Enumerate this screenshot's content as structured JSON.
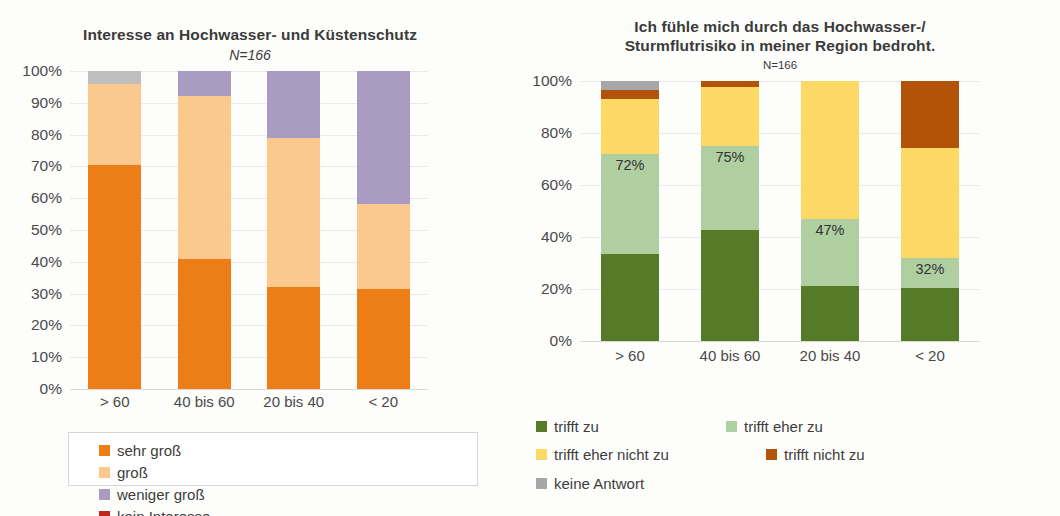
{
  "chart_data": [
    {
      "id": "interest",
      "type": "bar",
      "subtype": "stacked-100",
      "title": "Interesse an Hochwasser- und Küstenschutz",
      "subtitle": "N=166",
      "xlabel": "",
      "ylabel": "",
      "ylim": [
        0,
        100
      ],
      "yticks": [
        "0%",
        "10%",
        "20%",
        "30%",
        "40%",
        "50%",
        "60%",
        "70%",
        "80%",
        "90%",
        "100%"
      ],
      "ytick_values": [
        0,
        10,
        20,
        30,
        40,
        50,
        60,
        70,
        80,
        90,
        100
      ],
      "grid": true,
      "legend_position": "bottom",
      "legend_boxed": true,
      "categories": [
        "> 60",
        "40 bis 60",
        "20 bis 40",
        "< 20"
      ],
      "series": [
        {
          "name": "sehr groß",
          "color": "#ED7D17",
          "values": [
            70.5,
            41.0,
            32.0,
            31.5
          ]
        },
        {
          "name": "groß",
          "color": "#FBC98E",
          "values": [
            25.5,
            51.0,
            47.0,
            26.5
          ]
        },
        {
          "name": "weniger groß",
          "color": "#A99BC1",
          "values": [
            0.0,
            8.0,
            21.0,
            42.0
          ]
        },
        {
          "name": "kein Interesse",
          "color": "#C0271C",
          "values": [
            0.0,
            0.0,
            0.0,
            0.0
          ]
        },
        {
          "name": "keine Antwort",
          "color": "#BFBFBF",
          "values": [
            4.0,
            0.0,
            0.0,
            0.0
          ]
        }
      ],
      "legend_entries": [
        {
          "label": "sehr groß",
          "color": "#ED7D17"
        },
        {
          "label": "groß",
          "color": "#FBC98E"
        },
        {
          "label": "weniger groß",
          "color": "#A99BC1"
        },
        {
          "label": "kein Interesse",
          "color": "#C0271C"
        }
      ]
    },
    {
      "id": "threat",
      "type": "bar",
      "subtype": "stacked-100",
      "title": "Ich fühle mich durch das Hochwasser-/\nSturmflutrisiko in meiner Region bedroht.",
      "title_line1": "Ich fühle mich durch das Hochwasser-/",
      "title_line2": "Sturmflutrisiko in meiner Region bedroht.",
      "subtitle": "N=166",
      "xlabel": "",
      "ylabel": "",
      "ylim": [
        0,
        100
      ],
      "yticks": [
        "0%",
        "20%",
        "40%",
        "60%",
        "80%",
        "100%"
      ],
      "ytick_values": [
        0,
        20,
        40,
        60,
        80,
        100
      ],
      "grid": true,
      "legend_position": "bottom",
      "legend_boxed": false,
      "categories": [
        "> 60",
        "40 bis 60",
        "20 bis 40",
        "< 20"
      ],
      "series": [
        {
          "name": "trifft zu",
          "color": "#557B29",
          "values": [
            33.5,
            42.5,
            21.0,
            20.5
          ]
        },
        {
          "name": "trifft eher zu",
          "color": "#AFCFA0",
          "values": [
            38.5,
            32.5,
            26.0,
            11.5
          ]
        },
        {
          "name": "trifft eher nicht zu",
          "color": "#FCD964",
          "values": [
            21.0,
            22.5,
            53.0,
            42.0
          ]
        },
        {
          "name": "trifft nicht zu",
          "color": "#B35309",
          "values": [
            3.5,
            2.5,
            0.0,
            26.0
          ]
        },
        {
          "name": "keine Antwort",
          "color": "#A6A6A6",
          "values": [
            3.5,
            0.0,
            0.0,
            0.0
          ]
        }
      ],
      "data_labels": [
        {
          "category": "> 60",
          "text": "72%",
          "series": "trifft eher zu",
          "cumulative": 72
        },
        {
          "category": "40 bis 60",
          "text": "75%",
          "series": "trifft eher zu",
          "cumulative": 75
        },
        {
          "category": "20 bis 40",
          "text": "47%",
          "series": "trifft eher zu",
          "cumulative": 47
        },
        {
          "category": "< 20",
          "text": "32%",
          "series": "trifft eher zu",
          "cumulative": 32
        }
      ],
      "legend_entries": [
        {
          "label": "trifft zu",
          "color": "#557B29"
        },
        {
          "label": "trifft eher zu",
          "color": "#AFCFA0"
        },
        {
          "label": "trifft eher nicht zu",
          "color": "#FCD964"
        },
        {
          "label": "trifft nicht zu",
          "color": "#B35309"
        },
        {
          "label": "keine Antwort",
          "color": "#A6A6A6"
        }
      ]
    }
  ]
}
